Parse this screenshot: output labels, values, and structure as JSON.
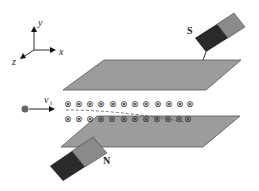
{
  "diagram": {
    "axes": {
      "x_label": "x",
      "y_label": "y",
      "z_label": "z"
    },
    "magnets": {
      "top": {
        "pole_label": "S",
        "dark_color": "#2a2a2a",
        "light_color": "#8a8a8a"
      },
      "bottom": {
        "pole_label": "N",
        "dark_color": "#2a2a2a",
        "light_color": "#8a8a8a"
      }
    },
    "plates": {
      "color": "#999999",
      "edge_color": "#555555"
    },
    "particle": {
      "velocity_label": "v",
      "velocity_subscript": "i",
      "color": "#666666"
    },
    "field": {
      "symbol": "⊗",
      "direction": "into page",
      "row1_count": 12,
      "row2_count": 12
    }
  }
}
